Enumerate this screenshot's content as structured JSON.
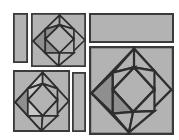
{
  "figure": {
    "width": 179,
    "height": 140,
    "background_color": "#ffffff",
    "panel_fill_color": "#b3b3b3",
    "panel_stroke_color": "#3a3a3a",
    "shaded_piece_color": "#8f8f8f",
    "highlight_piece_color": "#c9c9c9",
    "line_color": "#2e2e2e"
  },
  "panels": [
    {
      "id": "panel-top-left-bar",
      "label": "thin vertical bar, top left",
      "kind": "empty-bar",
      "x": 13,
      "y": 13,
      "width": 15,
      "height": 50,
      "content": ""
    },
    {
      "id": "panel-top-middle-dissection",
      "label": "square with rotated-square dissection, top middle",
      "kind": "dissection",
      "x": 31,
      "y": 13,
      "width": 55,
      "height": 54,
      "content": ""
    },
    {
      "id": "panel-top-right-bar",
      "label": "wide horizontal rectangle, top right",
      "kind": "empty-bar",
      "x": 89,
      "y": 13,
      "width": 85,
      "height": 30,
      "content": ""
    },
    {
      "id": "panel-bottom-left-dissection",
      "label": "square with rotated-square dissection, bottom left",
      "kind": "dissection",
      "x": 13,
      "y": 70,
      "width": 57,
      "height": 62,
      "content": ""
    },
    {
      "id": "panel-bottom-middle-bar",
      "label": "thin vertical bar, bottom middle",
      "kind": "empty-bar",
      "x": 72,
      "y": 72,
      "width": 14,
      "height": 60,
      "content": ""
    },
    {
      "id": "panel-bottom-right-dissection",
      "label": "large square with rotated-square dissection, bottom right",
      "kind": "dissection",
      "x": 89,
      "y": 46,
      "width": 85,
      "height": 89,
      "content": ""
    }
  ],
  "chart_data": {
    "type": "diagram",
    "panel_count": 6,
    "dissection_panel_count": 3,
    "empty_panel_count": 3,
    "dissection_piece_count": 9,
    "dissection_geometry": {
      "outer_shape": "rotated square (diamond) inscribed in panel",
      "pieces": [
        "left dark wedge triangle",
        "upper-left triangle",
        "upper-center triangle",
        "right inner square",
        "lower-center triangle",
        "lower-left triangle",
        "bottom wedge triangle",
        "corner triangle top",
        "corner triangle bottom"
      ]
    },
    "colors": {
      "background": "#ffffff",
      "panel_fill": "#b3b3b3",
      "panel_stroke": "#3a3a3a",
      "shaded_piece": "#8f8f8f",
      "light_piece": "#c9c9c9"
    }
  }
}
